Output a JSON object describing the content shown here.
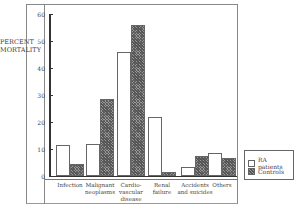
{
  "chart_data": {
    "type": "bar",
    "title": "",
    "xlabel": "",
    "ylabel": "PERCENT MORTALITY",
    "ylim": [
      0,
      60
    ],
    "yticks": [
      0,
      10,
      20,
      30,
      40,
      50,
      60
    ],
    "grid": false,
    "legend_position": "right",
    "categories": [
      "Infection",
      "Malignant neoplasms",
      "Cardio-vascular disease",
      "Renal failure",
      "Accidents and suicides",
      "Others"
    ],
    "series": [
      {
        "name": "RA patients",
        "pattern": "white",
        "values": [
          11.5,
          12,
          46,
          22,
          3.5,
          8.5
        ]
      },
      {
        "name": "Controls",
        "pattern": "hatched",
        "values": [
          4.5,
          28.5,
          56,
          1.5,
          7.5,
          6.5
        ]
      }
    ]
  },
  "labels": {
    "ylabel_line1": "PERCENT",
    "ylabel_line2": "MORTALITY",
    "yticks": [
      "60",
      "50",
      "40",
      "30",
      "20",
      "10",
      "0"
    ],
    "categories": [
      [
        "Infection"
      ],
      [
        "Malignant",
        "neoplasms"
      ],
      [
        "Cardio-",
        "vascular",
        "disease"
      ],
      [
        "Renal",
        "failure"
      ],
      [
        "Accidents",
        "and suicides"
      ],
      [
        "Others"
      ]
    ],
    "legend": [
      "RA patients",
      "Controls"
    ]
  }
}
